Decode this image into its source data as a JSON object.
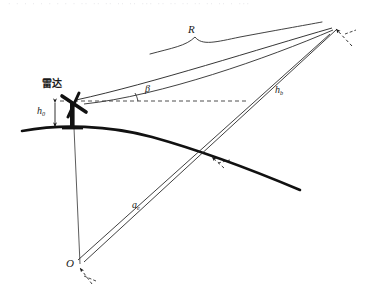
{
  "figure": {
    "title_fragment": "图 雷达探测目标几何关系示意图",
    "caption_visible": false,
    "background_color": "#ffffff",
    "ink_color": "#1a1a1a",
    "earth_curve_color": "#111111",
    "width": 365,
    "height": 299
  },
  "labels": {
    "radar": {
      "text": "雷达",
      "meaning": "radar-station",
      "x": 42,
      "y": 80
    },
    "radar_height": {
      "symbol": "h",
      "subscript": "0",
      "meaning": "radar-antenna-height-above-ground",
      "x": 38,
      "y": 108
    },
    "slant_range": {
      "symbol": "R",
      "subscript": "",
      "meaning": "slant-range-radar-to-target",
      "x": 188,
      "y": 28
    },
    "elevation_angle": {
      "symbol": "β",
      "subscript": "",
      "meaning": "elevation-angle-above-horizontal",
      "x": 120,
      "y": 86
    },
    "target_height": {
      "symbol": "h",
      "subscript": "b",
      "meaning": "target-height-above-earth-surface",
      "x": 276,
      "y": 86
    },
    "earth_radius": {
      "symbol": "a",
      "subscript": "e",
      "meaning": "effective-earth-radius",
      "x": 133,
      "y": 202
    },
    "origin": {
      "symbol": "O",
      "subscript": "",
      "meaning": "earth-center-origin",
      "x": 68,
      "y": 262
    }
  },
  "geometry": {
    "origin_point": {
      "x": 80,
      "y": 264
    },
    "radar_point": {
      "x": 73,
      "y": 128
    },
    "radar_top_point": {
      "x": 73,
      "y": 103
    },
    "target_point": {
      "x": 333,
      "y": 27
    },
    "surface_intersection_point": {
      "x": 212,
      "y": 158
    },
    "horizon_dash_start": {
      "x": 73,
      "y": 101
    },
    "horizon_dash_end": {
      "x": 248,
      "y": 101
    },
    "earth_arc": {
      "left_end": {
        "x": 22,
        "y": 131
      },
      "apex": {
        "x": 128,
        "y": 127
      },
      "right_end": {
        "x": 300,
        "y": 190
      }
    },
    "brace": {
      "left": {
        "x": 150,
        "y": 55
      },
      "tip": {
        "x": 196,
        "y": 36
      },
      "right": {
        "x": 320,
        "y": 24
      }
    }
  },
  "elements": [
    {
      "name": "earth-surface-arc",
      "kind": "curve"
    },
    {
      "name": "slant-range-line",
      "kind": "line"
    },
    {
      "name": "horizontal-reference-dashed-line",
      "kind": "dashed-line"
    },
    {
      "name": "elevation-angle-arc",
      "kind": "arc"
    },
    {
      "name": "radar-antenna-glyph",
      "kind": "icon"
    },
    {
      "name": "radar-height-dimension-arrow",
      "kind": "dimension"
    },
    {
      "name": "earth-radius-line-to-target",
      "kind": "line"
    },
    {
      "name": "earth-radius-line-to-surface",
      "kind": "line"
    },
    {
      "name": "vertical-radius-line-to-radar",
      "kind": "line"
    },
    {
      "name": "target-height-segment",
      "kind": "line"
    },
    {
      "name": "slant-range-brace",
      "kind": "brace"
    },
    {
      "name": "origin-angle-arrow",
      "kind": "arrow"
    },
    {
      "name": "target-marker-arrow",
      "kind": "arrow"
    },
    {
      "name": "surface-intersection-arrow",
      "kind": "arrow"
    }
  ]
}
